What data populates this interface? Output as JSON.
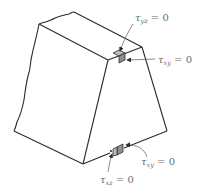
{
  "diagram": {
    "colors": {
      "outline": "#2b2b2b",
      "element_fill": "#9a9a9a",
      "element_top_fill": "#bdbdbd",
      "label": "#6b6b6b",
      "leader": "#6b6b6b"
    },
    "labels": [
      {
        "id": "tau_yz_top",
        "symbol": "τ",
        "subscript": "yz",
        "equals": "= 0"
      },
      {
        "id": "tau_xy_top",
        "symbol": "τ",
        "subscript": "xy",
        "equals": "= 0"
      },
      {
        "id": "tau_xy_bottom",
        "symbol": "τ",
        "subscript": "xy",
        "equals": "= 0"
      },
      {
        "id": "tau_xz_bottom",
        "symbol": "τ",
        "subscript": "xz",
        "equals": "= 0"
      }
    ]
  }
}
